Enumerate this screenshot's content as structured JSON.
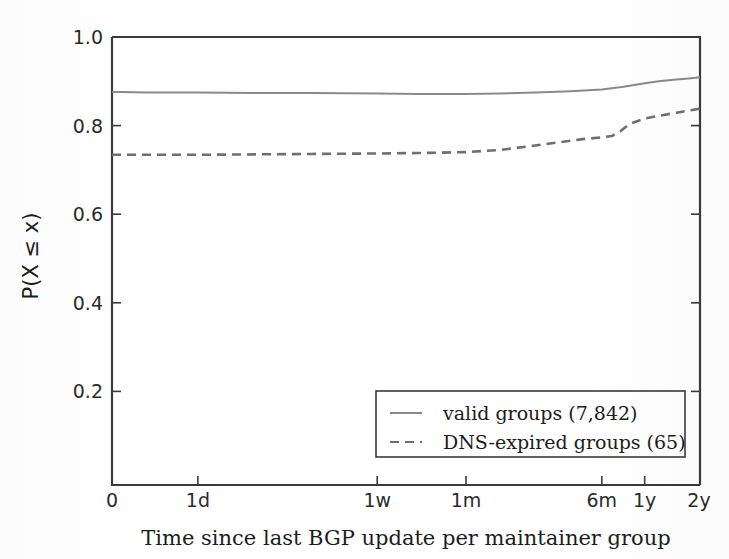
{
  "chart_data": {
    "type": "line",
    "title": "",
    "subtitle": "",
    "xlabel": "Time since last BGP update per maintainer group",
    "ylabel": "P(X ≤ x)",
    "grid": false,
    "legend_position": "lower right",
    "ylim": [
      0.0,
      1.0
    ],
    "yticks": [
      0.2,
      0.4,
      0.6,
      0.8,
      1.0
    ],
    "ytick_labels": [
      "0.2",
      "0.4",
      "0.6",
      "0.8",
      "1.0"
    ],
    "xlim": [
      0,
      100
    ],
    "xticks": [
      0,
      14.6,
      45.1,
      60.2,
      83.3,
      90.6,
      100
    ],
    "xtick_labels": [
      "0",
      "1d",
      "1w",
      "1m",
      "6m",
      "1y",
      "2y"
    ],
    "series": [
      {
        "name": "valid groups (7,842)",
        "style": "solid",
        "color": "#8a8a8a",
        "x": [
          0,
          1.5,
          6,
          14.6,
          24,
          34,
          45.1,
          52,
          60.2,
          66,
          72,
          78,
          83.3,
          87,
          90.6,
          93,
          96,
          98.5,
          100
        ],
        "y": [
          0.877,
          0.877,
          0.876,
          0.876,
          0.875,
          0.875,
          0.874,
          0.873,
          0.873,
          0.874,
          0.876,
          0.879,
          0.883,
          0.889,
          0.897,
          0.901,
          0.905,
          0.908,
          0.91
        ]
      },
      {
        "name": "DNS-expired groups (65)",
        "style": "dashed",
        "color": "#6f6f6f",
        "x": [
          0,
          2,
          8,
          14.6,
          24,
          34,
          45.1,
          52,
          60.2,
          66,
          71,
          76,
          80,
          83.3,
          85,
          86.5,
          88,
          90.6,
          93,
          96,
          100
        ],
        "y": [
          0.737,
          0.737,
          0.737,
          0.737,
          0.738,
          0.739,
          0.74,
          0.741,
          0.743,
          0.748,
          0.756,
          0.765,
          0.772,
          0.776,
          0.779,
          0.79,
          0.806,
          0.818,
          0.824,
          0.831,
          0.84
        ]
      }
    ],
    "legend_entries": [
      {
        "label": "valid groups (7,842)",
        "style": "solid"
      },
      {
        "label": "DNS-expired groups (65)",
        "style": "dashed"
      }
    ]
  },
  "style": {
    "axis_color": "#3a3a3a",
    "text_color": "#1c1c1c",
    "background": "#ffffff",
    "solid_series_color": "#8a8a8a",
    "dashed_series_color": "#6f6f6f"
  }
}
